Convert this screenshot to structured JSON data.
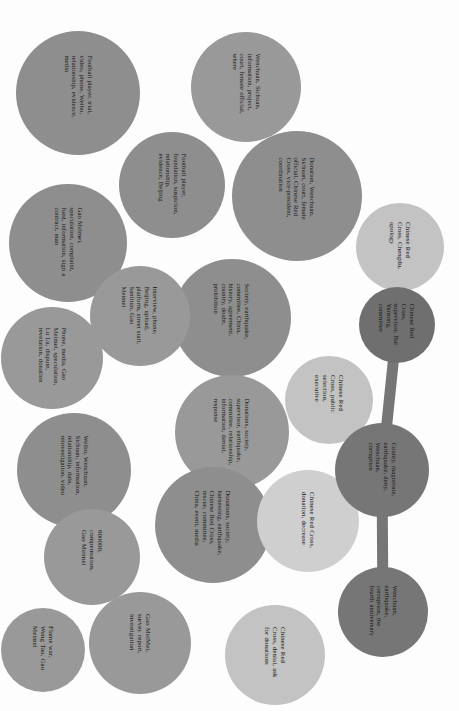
{
  "figure": {
    "type": "bubble-cluster-diagram",
    "orientation": "rotated-90",
    "background_color": "#fdfdfd",
    "text_color": "#151515",
    "palette": {
      "mid_gray": "#8e8e8e",
      "gray": "#999999",
      "light_gray": "#c3c3c3",
      "lighter_gray": "#cfcfcf",
      "dark_gray": "#767676",
      "darker_gray": "#6f6f6f",
      "link": "#767676"
    }
  },
  "chart_data": {
    "type": "bubble",
    "title": "",
    "xlabel": "",
    "ylabel": "",
    "legend": [],
    "grid": false,
    "note": "Circle-packing of topic keyword clusters; three dark nodes are joined by connector links.",
    "nodes": [
      {
        "id": "n1",
        "label": "Football player, trial, video, phone, Weibo, relationship, evidence, media",
        "cx": 78,
        "cy": 93,
        "r": 62,
        "color": "#8e8e8e",
        "font": 6.6,
        "tw": 74
      },
      {
        "id": "n2",
        "label": "Football player, foundation, suspicion, relationship, evidence, Beijing",
        "cx": 172,
        "cy": 185,
        "r": 53,
        "color": "#8e8e8e",
        "font": 6.6,
        "tw": 62
      },
      {
        "id": "n3",
        "label": "Gao Meimei, speculation, complaint, fued, information, sign a contract, man",
        "cx": 68,
        "cy": 243,
        "r": 59,
        "color": "#8e8e8e",
        "font": 6.6,
        "tw": 70
      },
      {
        "id": "n4",
        "label": "Wenchuan, Sichuan, information, project, court, female official, where",
        "cx": 246,
        "cy": 87,
        "r": 55,
        "color": "#999999",
        "font": 6.6,
        "tw": 66
      },
      {
        "id": "n5",
        "label": "Donation, Wenchuan, Sichuan, court, female official, Chinese Red Cross, vice-president, coordination",
        "cx": 297,
        "cy": 196,
        "r": 65,
        "color": "#8e8e8e",
        "font": 6.6,
        "tw": 78
      },
      {
        "id": "n6",
        "label": "Chinese Red Cross, Chengdu, apology",
        "cx": 400,
        "cy": 247,
        "r": 44,
        "color": "#c3c3c3",
        "font": 6.8,
        "tw": 50
      },
      {
        "id": "n7",
        "label": "Society, earthquake, committee, China, history, agreement, country, doubt, prohibition",
        "cx": 232,
        "cy": 318,
        "r": 59,
        "color": "#8e8e8e",
        "font": 6.6,
        "tw": 70
      },
      {
        "id": "n8",
        "label": "Interview, phone, Beijing, upload, platform, street stall, Sanlitun, Gao Meimei",
        "cx": 140,
        "cy": 316,
        "r": 50,
        "color": "#999999",
        "font": 6.6,
        "tw": 60
      },
      {
        "id": "n9",
        "label": "Phone, media, Gao Meimei, speculation, Lu Lu, dispute, revelation, donation",
        "cx": 52,
        "cy": 358,
        "r": 51,
        "color": "#999999",
        "font": 6.6,
        "tw": 60
      },
      {
        "id": "n10",
        "label": "Weibo, Wenchuan, Sichuan, information, relationship, data, reinvestigation, video",
        "cx": 74,
        "cy": 470,
        "r": 57,
        "color": "#8e8e8e",
        "font": 6.6,
        "tw": 68
      },
      {
        "id": "n11",
        "label": "600000, compensation, Gao Meimei",
        "cx": 92,
        "cy": 557,
        "r": 48,
        "color": "#999999",
        "font": 6.8,
        "tw": 54
      },
      {
        "id": "n12",
        "label": "Flame war, Weng Tao, Gao Meimei",
        "cx": 43,
        "cy": 650,
        "r": 42,
        "color": "#999999",
        "font": 6.8,
        "tw": 48
      },
      {
        "id": "n13",
        "label": "Gao MeiMei, survey report, investigation",
        "cx": 140,
        "cy": 643,
        "r": 51,
        "color": "#999999",
        "font": 6.8,
        "tw": 58
      },
      {
        "id": "n14",
        "label": "Donations, society, supervisor, earthquake, committee, relationship, information, denial, response",
        "cx": 232,
        "cy": 432,
        "r": 57,
        "color": "#999999",
        "font": 6.6,
        "tw": 68
      },
      {
        "id": "n15",
        "label": "Donations, society, harnessing, earthquake, Chinese Red Cross, rescue, committee, China, event, media",
        "cx": 213,
        "cy": 525,
        "r": 58,
        "color": "#8e8e8e",
        "font": 6.6,
        "tw": 70
      },
      {
        "id": "n16",
        "label": "Chinese Red Cross, denial, ask for donations",
        "cx": 275,
        "cy": 655,
        "r": 50,
        "color": "#c3c3c3",
        "font": 6.8,
        "tw": 56
      },
      {
        "id": "n17",
        "label": "Chinese Red Cross, donation, decrease",
        "cx": 308,
        "cy": 521,
        "r": 51,
        "color": "#cfcfcf",
        "font": 6.8,
        "tw": 58
      },
      {
        "id": "n18",
        "label": "Chinese Red Cross, public selection, executive",
        "cx": 329,
        "cy": 400,
        "r": 44,
        "color": "#c3c3c3",
        "font": 6.8,
        "tw": 50
      },
      {
        "id": "n19",
        "label": "Chinese Red Cross, supervisor, Bai Yansong, committee",
        "cx": 397,
        "cy": 325,
        "r": 38,
        "color": "#6f6f6f",
        "font": 6.6,
        "tw": 44
      },
      {
        "id": "n20",
        "label": "County, magistrate, earthquake, deny, Wenchuan, corruption",
        "cx": 382,
        "cy": 470,
        "r": 47,
        "color": "#767676",
        "font": 6.6,
        "tw": 54
      },
      {
        "id": "n21",
        "label": "Wenchuan, earthquake, corruption, the fourth anniversary",
        "cx": 383,
        "cy": 612,
        "r": 45,
        "color": "#767676",
        "font": 6.6,
        "tw": 52
      }
    ],
    "links": [
      {
        "source": "n19",
        "target": "n20",
        "width": 11,
        "color": "#767676"
      },
      {
        "source": "n20",
        "target": "n21",
        "width": 11,
        "color": "#767676"
      }
    ]
  }
}
